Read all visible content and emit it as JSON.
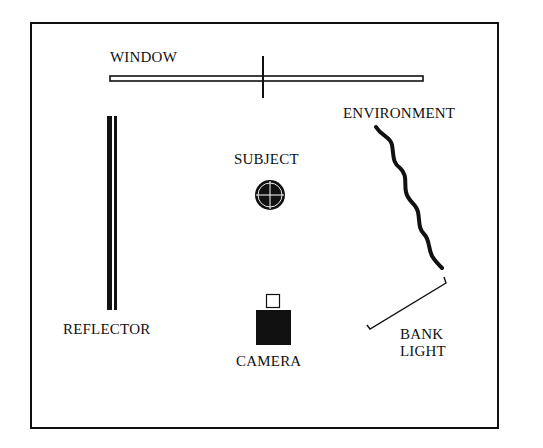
{
  "diagram": {
    "labels": {
      "window": "WINDOW",
      "environment": "ENVIRONMENT",
      "subject": "SUBJECT",
      "reflector": "REFLECTOR",
      "camera": "CAMERA",
      "bank_light_line1": "BANK",
      "bank_light_line2": "LIGHT"
    },
    "colors": {
      "ink": "#111111",
      "background": "#ffffff"
    }
  }
}
